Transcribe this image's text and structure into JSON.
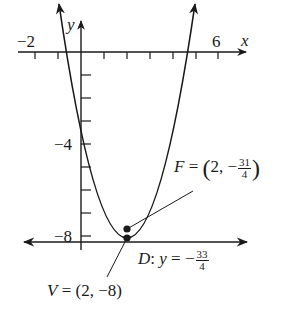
{
  "diagram": {
    "type": "parabola-focus-directrix",
    "axes": {
      "x_label": "x",
      "y_label": "y",
      "x_tick_labels": [
        {
          "value": -2,
          "text": "−2"
        },
        {
          "value": 6,
          "text": "6"
        }
      ],
      "y_tick_labels": [
        {
          "value": -4,
          "text": "−4"
        },
        {
          "value": -8,
          "text": "−8"
        }
      ],
      "x_range": [
        -2,
        6
      ],
      "y_range": [
        -8,
        1
      ]
    },
    "parabola": {
      "equation": "y = (1/2)(x - 2)^2 - 8",
      "vertex": [
        2,
        -8
      ],
      "opens": "up"
    },
    "points": {
      "focus": {
        "name": "F",
        "eq": " = ",
        "x": "2",
        "sep": ", ",
        "sign": "−",
        "num": "31",
        "den": "4",
        "lparen": "(",
        "rparen": ")"
      },
      "vertex": {
        "name": "V",
        "text": " = (2, −8)"
      }
    },
    "directrix": {
      "name": "D",
      "colon": ":",
      "var": "y",
      "eq": " = −",
      "num": "33",
      "den": "4"
    },
    "colors": {
      "ink": "#1a1a1a",
      "background": "#ffffff"
    }
  }
}
